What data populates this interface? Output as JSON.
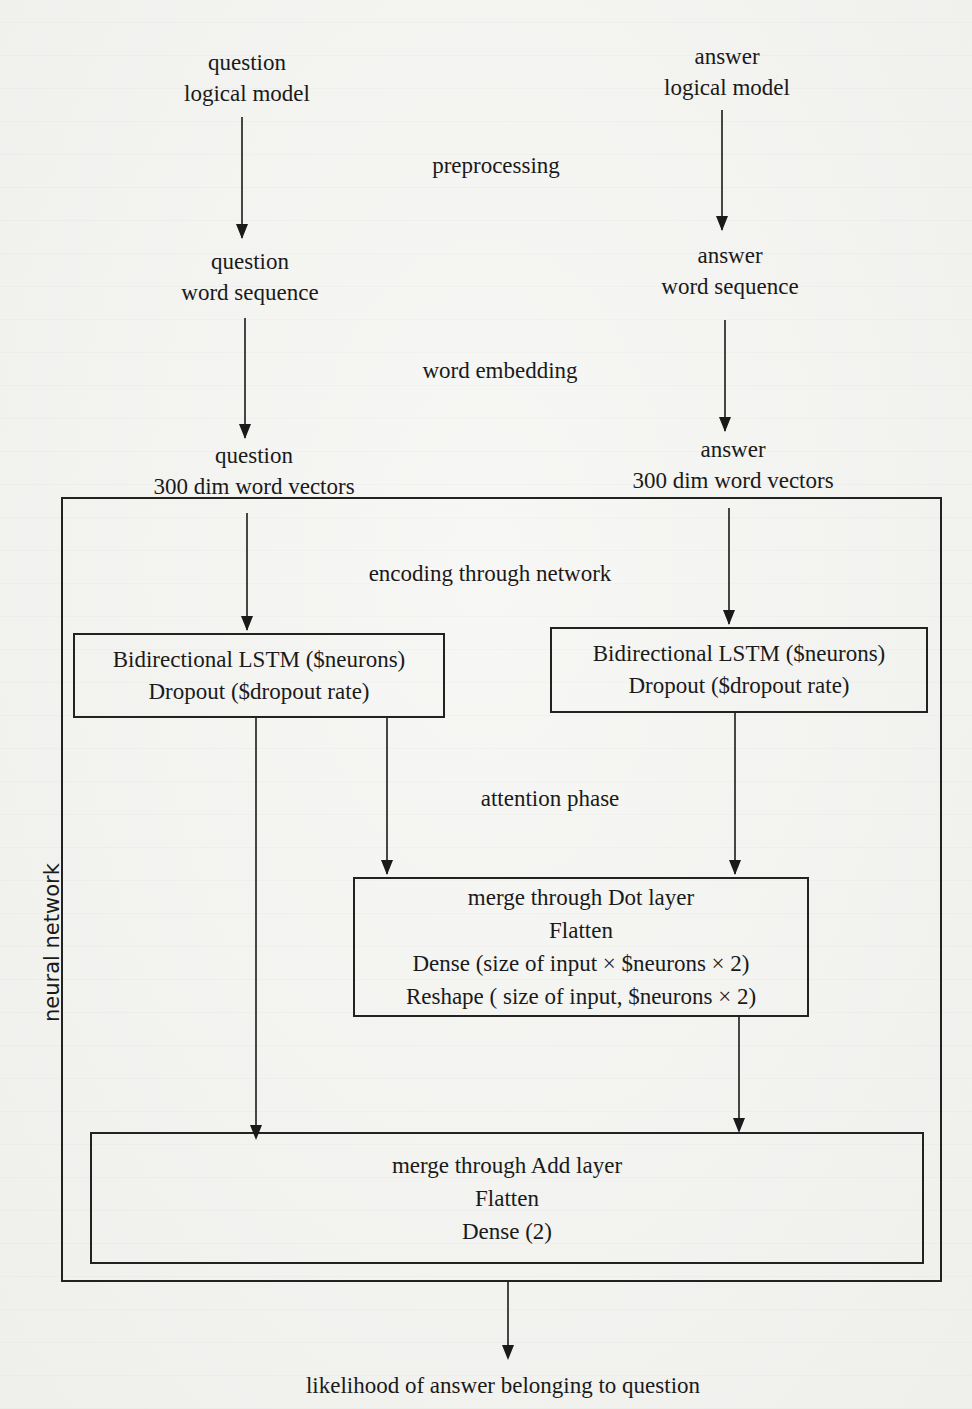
{
  "figure": {
    "type": "flow diagram",
    "input_left": {
      "line1": "question",
      "line2": "logical model"
    },
    "input_right": {
      "line1": "answer",
      "line2": "logical model"
    },
    "step_preprocessing": "preprocessing",
    "seq_left": {
      "line1": "question",
      "line2": "word sequence"
    },
    "seq_right": {
      "line1": "answer",
      "line2": "word sequence"
    },
    "step_embedding": "word embedding",
    "vec_left": {
      "line1": "question",
      "line2": "300 dim word vectors"
    },
    "vec_right": {
      "line1": "answer",
      "line2": "300 dim word vectors"
    },
    "network": {
      "side_label": "neural network",
      "encoding_label": "encoding through network",
      "lstm_left": {
        "line1": "Bidirectional LSTM ($neurons)",
        "line2": "Dropout ($dropout rate)"
      },
      "lstm_right": {
        "line1": "Bidirectional LSTM ($neurons)",
        "line2": "Dropout ($dropout rate)"
      },
      "attention_label": "attention phase",
      "dot_box": {
        "line1": "merge through Dot layer",
        "line2": "Flatten",
        "line3": "Dense (size of input × $neurons × 2)",
        "line4": "Reshape ( size of input, $neurons × 2)"
      },
      "add_box": {
        "line1": "merge through Add layer",
        "line2": "Flatten",
        "line3": "Dense (2)"
      }
    },
    "output_label": "likelihood of answer belonging to question"
  },
  "colors": {
    "background": "#f4f4f2",
    "ink": "#1a1a1a"
  }
}
